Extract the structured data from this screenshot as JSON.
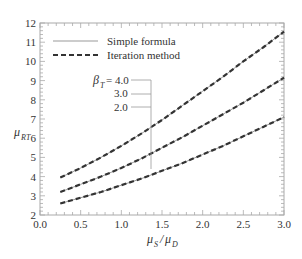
{
  "chart_data": {
    "type": "line",
    "title": "",
    "xlabel": "μS/μD",
    "ylabel": "μRT",
    "xlim": [
      0.0,
      3.0
    ],
    "ylim": [
      2,
      12
    ],
    "grid": false,
    "x_ticks": [
      "0.0",
      "0.5",
      "1.0",
      "1.5",
      "2.0",
      "2.5",
      "3.0"
    ],
    "y_ticks": [
      "2",
      "3",
      "4",
      "5",
      "6",
      "7",
      "8",
      "9",
      "10",
      "11",
      "12"
    ],
    "legend": {
      "position": "upper left",
      "entries": [
        {
          "label": "Simple formula",
          "style": "solid thin gray"
        },
        {
          "label": "Iteration method",
          "style": "dashed thick dark"
        }
      ]
    },
    "annotation": {
      "prefix": "βT = ",
      "labels": [
        "4.0",
        "3.0",
        "2.0"
      ],
      "leader_x": 1.37
    },
    "x": [
      0.25,
      0.5,
      0.75,
      1.0,
      1.25,
      1.5,
      1.75,
      2.0,
      2.25,
      2.5,
      2.75,
      3.0
    ],
    "series": [
      {
        "name": "βT = 4.0 (Simple formula)",
        "values": [
          3.95,
          4.45,
          5.0,
          5.6,
          6.25,
          6.95,
          7.7,
          8.45,
          9.2,
          10.0,
          10.75,
          11.55
        ]
      },
      {
        "name": "βT = 4.0 (Iteration method)",
        "values": [
          3.95,
          4.45,
          5.0,
          5.6,
          6.25,
          6.95,
          7.7,
          8.45,
          9.2,
          10.0,
          10.75,
          11.55
        ]
      },
      {
        "name": "βT = 3.0 (Simple formula)",
        "values": [
          3.2,
          3.6,
          4.0,
          4.45,
          4.95,
          5.5,
          6.05,
          6.65,
          7.25,
          7.85,
          8.5,
          9.15
        ]
      },
      {
        "name": "βT = 3.0 (Iteration method)",
        "values": [
          3.2,
          3.6,
          4.0,
          4.45,
          4.95,
          5.5,
          6.05,
          6.65,
          7.25,
          7.85,
          8.5,
          9.15
        ]
      },
      {
        "name": "βT = 2.0 (Simple formula)",
        "values": [
          2.6,
          2.9,
          3.2,
          3.55,
          3.9,
          4.3,
          4.7,
          5.15,
          5.6,
          6.1,
          6.6,
          7.1
        ]
      },
      {
        "name": "βT = 2.0 (Iteration method)",
        "values": [
          2.6,
          2.9,
          3.2,
          3.55,
          3.9,
          4.3,
          4.7,
          5.15,
          5.6,
          6.1,
          6.6,
          7.1
        ]
      }
    ]
  },
  "labels": {
    "xlabel_main1": "μ",
    "xlabel_sub1": "S",
    "xlabel_slash": "/",
    "xlabel_main2": "μ",
    "xlabel_sub2": "D",
    "ylabel_main": "μ",
    "ylabel_sub": "RT",
    "beta_main": "β",
    "beta_sub": "T",
    "beta_eq": "= 4.0",
    "beta_3": "3.0",
    "beta_2": "2.0",
    "legend_simple": "Simple formula",
    "legend_iteration": "Iteration method"
  },
  "colors": {
    "axis": "#aaaaaa",
    "simple_line": "#999999",
    "iteration_line": "#333333",
    "text": "#333333"
  }
}
